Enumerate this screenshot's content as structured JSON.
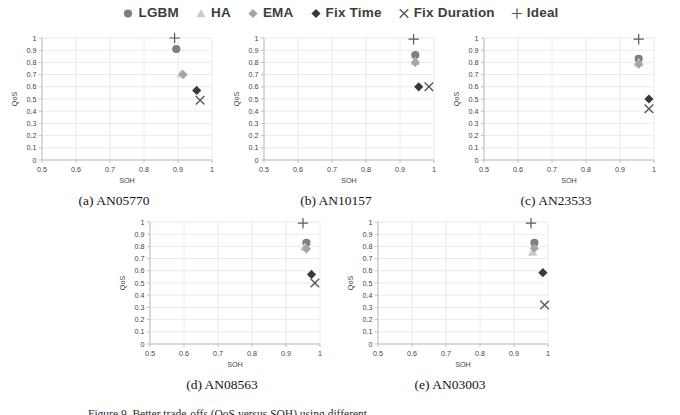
{
  "figure": {
    "legend": [
      {
        "label": "LGBM",
        "marker": "circle",
        "color": "#7F7F7F"
      },
      {
        "label": "HA",
        "marker": "triangle",
        "color": "#CBCBCB"
      },
      {
        "label": "EMA",
        "marker": "diamond",
        "color": "#A5A5A5"
      },
      {
        "label": "Fix Time",
        "marker": "diamond",
        "color": "#3B3838"
      },
      {
        "label": "Fix Duration",
        "marker": "cross",
        "color": "#595959"
      },
      {
        "label": "Ideal",
        "marker": "plus",
        "color": "#595959"
      }
    ],
    "caption_partial": "Figure 9. Better trade-offs (QoS versus SOH) using different"
  },
  "style": {
    "grid_color": "#EAEAEA",
    "axis_color": "#BFBFBF",
    "tick_text_color": "#3f3f3f"
  },
  "chart_data": [
    {
      "type": "scatter",
      "caption": "(a) AN05770",
      "xlabel": "SOH",
      "ylabel": "QoS",
      "xlim": [
        0.5,
        1
      ],
      "ylim": [
        0,
        1
      ],
      "grid": true,
      "legend_position": "top-center-shared",
      "xticks": [
        "0.5",
        "0.6",
        "0.7",
        "0.8",
        "0.9",
        "1"
      ],
      "yticks": [
        "0",
        "0.1",
        "0.2",
        "0.3",
        "0.4",
        "0.5",
        "0.6",
        "0.7",
        "0.8",
        "0.9",
        "1"
      ],
      "series": [
        {
          "name": "LGBM",
          "x": 0.895,
          "y": 0.91
        },
        {
          "name": "HA",
          "x": 0.91,
          "y": 0.71
        },
        {
          "name": "EMA",
          "x": 0.915,
          "y": 0.7
        },
        {
          "name": "Fix Time",
          "x": 0.955,
          "y": 0.57
        },
        {
          "name": "Fix Duration",
          "x": 0.965,
          "y": 0.49
        },
        {
          "name": "Ideal",
          "x": 0.89,
          "y": 1.0
        }
      ]
    },
    {
      "type": "scatter",
      "caption": "(b) AN10157",
      "xlabel": "SOH",
      "ylabel": "QoS",
      "xlim": [
        0.5,
        1
      ],
      "ylim": [
        0,
        1
      ],
      "grid": true,
      "legend_position": "top-center-shared",
      "xticks": [
        "0.5",
        "0.6",
        "0.7",
        "0.8",
        "0.9",
        "1"
      ],
      "yticks": [
        "0",
        "0.1",
        "0.2",
        "0.3",
        "0.4",
        "0.5",
        "0.6",
        "0.7",
        "0.8",
        "0.9",
        "1"
      ],
      "series": [
        {
          "name": "LGBM",
          "x": 0.945,
          "y": 0.86
        },
        {
          "name": "HA",
          "x": 0.945,
          "y": 0.81
        },
        {
          "name": "EMA",
          "x": 0.945,
          "y": 0.8
        },
        {
          "name": "Fix Time",
          "x": 0.955,
          "y": 0.6
        },
        {
          "name": "Fix Duration",
          "x": 0.985,
          "y": 0.6
        },
        {
          "name": "Ideal",
          "x": 0.94,
          "y": 0.99
        }
      ]
    },
    {
      "type": "scatter",
      "caption": "(c) AN23533",
      "xlabel": "SOH",
      "ylabel": "QoS",
      "xlim": [
        0.5,
        1
      ],
      "ylim": [
        0,
        1
      ],
      "grid": true,
      "legend_position": "top-center-shared",
      "xticks": [
        "0.5",
        "0.6",
        "0.7",
        "0.8",
        "0.9",
        "1"
      ],
      "yticks": [
        "0",
        "0.1",
        "0.2",
        "0.3",
        "0.4",
        "0.5",
        "0.6",
        "0.7",
        "0.8",
        "0.9",
        "1"
      ],
      "series": [
        {
          "name": "LGBM",
          "x": 0.955,
          "y": 0.83
        },
        {
          "name": "HA",
          "x": 0.955,
          "y": 0.8
        },
        {
          "name": "EMA",
          "x": 0.955,
          "y": 0.785
        },
        {
          "name": "Fix Time",
          "x": 0.985,
          "y": 0.5
        },
        {
          "name": "Fix Duration",
          "x": 0.985,
          "y": 0.42
        },
        {
          "name": "Ideal",
          "x": 0.955,
          "y": 0.99
        }
      ]
    },
    {
      "type": "scatter",
      "caption": "(d) AN08563",
      "xlabel": "SOH",
      "ylabel": "QoS",
      "xlim": [
        0.5,
        1
      ],
      "ylim": [
        0,
        1
      ],
      "grid": true,
      "legend_position": "top-center-shared",
      "xticks": [
        "0.5",
        "0.6",
        "0.7",
        "0.8",
        "0.9",
        "1"
      ],
      "yticks": [
        "0",
        "0.1",
        "0.2",
        "0.3",
        "0.4",
        "0.5",
        "0.6",
        "0.7",
        "0.8",
        "0.9",
        "1"
      ],
      "series": [
        {
          "name": "LGBM",
          "x": 0.96,
          "y": 0.83
        },
        {
          "name": "HA",
          "x": 0.955,
          "y": 0.795
        },
        {
          "name": "EMA",
          "x": 0.96,
          "y": 0.78
        },
        {
          "name": "Fix Time",
          "x": 0.975,
          "y": 0.57
        },
        {
          "name": "Fix Duration",
          "x": 0.985,
          "y": 0.5
        },
        {
          "name": "Ideal",
          "x": 0.95,
          "y": 0.99
        }
      ]
    },
    {
      "type": "scatter",
      "caption": "(e) AN03003",
      "xlabel": "SOH",
      "ylabel": "QoS",
      "xlim": [
        0.5,
        1
      ],
      "ylim": [
        0,
        1
      ],
      "grid": true,
      "legend_position": "top-center-shared",
      "xticks": [
        "0.5",
        "0.6",
        "0.7",
        "0.8",
        "0.9",
        "1"
      ],
      "yticks": [
        "0",
        "0.1",
        "0.2",
        "0.3",
        "0.4",
        "0.5",
        "0.6",
        "0.7",
        "0.8",
        "0.9",
        "1"
      ],
      "series": [
        {
          "name": "LGBM",
          "x": 0.96,
          "y": 0.83
        },
        {
          "name": "HA",
          "x": 0.955,
          "y": 0.755
        },
        {
          "name": "EMA",
          "x": 0.96,
          "y": 0.785
        },
        {
          "name": "Fix Time",
          "x": 0.985,
          "y": 0.585
        },
        {
          "name": "Fix Duration",
          "x": 0.99,
          "y": 0.32
        },
        {
          "name": "Ideal",
          "x": 0.95,
          "y": 0.99
        }
      ]
    }
  ]
}
